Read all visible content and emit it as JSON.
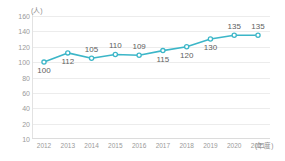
{
  "chart_data": {
    "type": "line",
    "title": "",
    "subtitle": "",
    "xlabel": "(年度)",
    "ylabel": "(人)",
    "categories": [
      "2012",
      "2013",
      "2014",
      "2015",
      "2016",
      "2017",
      "2018",
      "2019",
      "2020",
      "2021"
    ],
    "values": [
      100,
      112,
      105,
      110,
      109,
      115,
      120,
      130,
      135,
      135
    ],
    "series": [
      {
        "name": "",
        "values": [
          100,
          112,
          105,
          110,
          109,
          115,
          120,
          130,
          135,
          135
        ]
      }
    ],
    "data_labels": [
      "100",
      "112",
      "105",
      "110",
      "109",
      "115",
      "120",
      "130",
      "135",
      "135"
    ],
    "ylim": [
      0,
      160
    ],
    "yticks": [
      160,
      140,
      120,
      100,
      80,
      60,
      40,
      20,
      10
    ],
    "ytick_labels": [
      "160",
      "140",
      "120",
      "100",
      "80",
      "60",
      "40",
      "20",
      "10"
    ],
    "grid": true,
    "legend": null,
    "legend_position": "none",
    "colors": {
      "line": "#3cb6c8",
      "marker_fill": "#ffffff",
      "marker_stroke": "#3cb6c8",
      "grid": "#ececec",
      "tick_text": "#9a9a9a",
      "label_text": "#5e5e5e",
      "unit_text": "#8d8d8d",
      "background": "#ffffff"
    }
  }
}
